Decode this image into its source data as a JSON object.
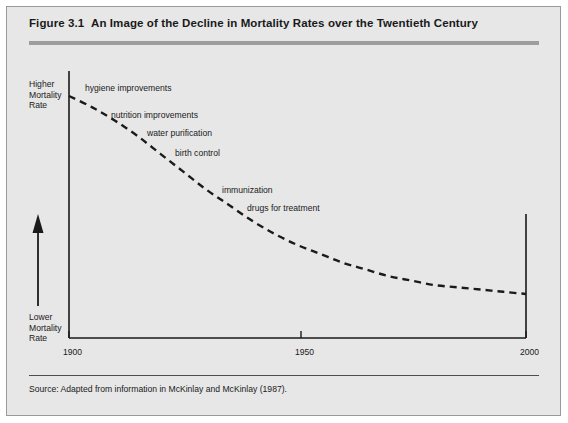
{
  "figure": {
    "number": "Figure 3.1",
    "title": "An Image of the Decline in Mortality Rates over the Twentieth Century",
    "source": "Source: Adapted from information in McKinlay and McKinlay (1987)."
  },
  "colors": {
    "panel_background": "#e7e7e7",
    "panel_border": "#9a9a9a",
    "header_rule": "#9d9d9d",
    "axis": "#1a1a1a",
    "curve": "#1a1a1a",
    "text": "#1a1a1a",
    "page_background": "#ffffff"
  },
  "chart_data": {
    "type": "line",
    "title": "An Image of the Decline in Mortality Rates over the Twentieth Century",
    "xlabel": "",
    "ylabel": "Mortality Rate",
    "ylabel_high": "Higher\nMortality\nRate",
    "ylabel_low": "Lower\nMortality\nRate",
    "xlim": [
      1900,
      2000
    ],
    "xticks": [
      1900,
      1950,
      2000
    ],
    "xticklabels": [
      "1900",
      "1950",
      "2000"
    ],
    "yticks": [],
    "yticklabels": [],
    "grid": false,
    "legend": false,
    "line_style": "dashed",
    "x": [
      1900,
      1905,
      1910,
      1915,
      1920,
      1925,
      1930,
      1935,
      1940,
      1945,
      1950,
      1955,
      1960,
      1965,
      1970,
      1975,
      1980,
      1985,
      1990,
      1995,
      2000
    ],
    "y": [
      100,
      95,
      89,
      82,
      74,
      66,
      58,
      51,
      44,
      38,
      33,
      29,
      25,
      22,
      19,
      17,
      15,
      14,
      13,
      12,
      11
    ],
    "annotations": [
      {
        "text": "hygiene improvements",
        "x": 1905,
        "y": 100
      },
      {
        "text": "nutrition improvements",
        "x": 1918,
        "y": 90
      },
      {
        "text": "water purification",
        "x": 1931,
        "y": 82
      },
      {
        "text": "birth control",
        "x": 1940,
        "y": 74
      },
      {
        "text": "immunization",
        "x": 1955,
        "y": 55
      },
      {
        "text": "drugs for treatment",
        "x": 1963,
        "y": 47
      }
    ],
    "y_axis_arrow": {
      "direction": "up",
      "meaning": "increasing mortality rate"
    }
  },
  "icons": {
    "up_arrow": "up-arrow-icon"
  }
}
